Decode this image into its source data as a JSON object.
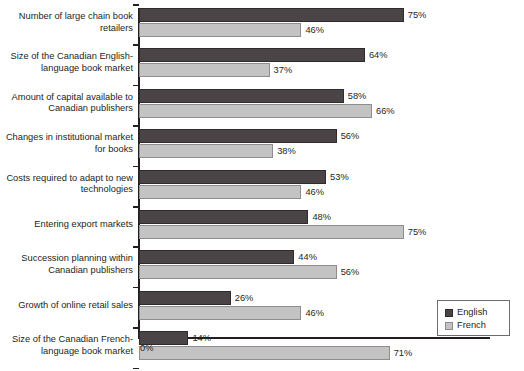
{
  "chart_data": {
    "type": "bar",
    "orientation": "horizontal",
    "title": "",
    "subtitle": "",
    "xlabel": "",
    "ylabel": "",
    "xlim": [
      0,
      100
    ],
    "grid": false,
    "value_suffix": "%",
    "x_tick_labels": [
      "0%"
    ],
    "legend_position": "bottom-right",
    "categories": [
      "Number of large chain book retailers",
      "Size of the Canadian English-language book market",
      "Amount of capital available to Canadian publishers",
      "Changes in institutional market for books",
      "Costs required to adapt to new technologies",
      "Entering export markets",
      "Succession planning within Canadian publishers",
      "Growth of online retail sales",
      "Size of the Canadian French-language book market"
    ],
    "series": [
      {
        "name": "English",
        "color": "#4a4447",
        "values": [
          75,
          64,
          58,
          56,
          53,
          48,
          44,
          26,
          14
        ],
        "labels": [
          "75%",
          "64%",
          "58%",
          "56%",
          "53%",
          "48%",
          "44%",
          "26%",
          "14%"
        ]
      },
      {
        "name": "French",
        "color": "#c3c3c3",
        "values": [
          46,
          37,
          66,
          38,
          46,
          75,
          56,
          46,
          71
        ],
        "labels": [
          "46%",
          "37%",
          "66%",
          "38%",
          "46%",
          "75%",
          "56%",
          "46%",
          "71%"
        ]
      }
    ]
  },
  "legend": {
    "items": [
      {
        "label": "English",
        "color": "#4a4447"
      },
      {
        "label": "French",
        "color": "#c3c3c3"
      }
    ]
  },
  "axis": {
    "zero_label": "0%"
  }
}
